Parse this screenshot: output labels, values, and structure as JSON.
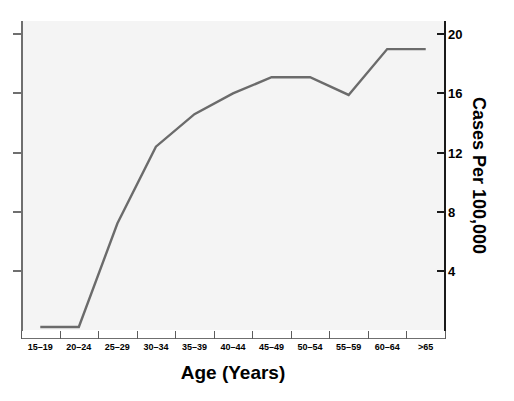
{
  "figure": {
    "title": "",
    "background_color": "#ffffff",
    "plot_background_color": "#f4f4f4",
    "line_color": "#6b6b6b"
  },
  "axes": {
    "x_title": "Age (Years)",
    "y_title": "Cases Per 100,000",
    "y_tick_labels": [
      "20",
      "16",
      "12",
      "8",
      "4"
    ],
    "y_tick_values": [
      20,
      16,
      12,
      8,
      4
    ],
    "y_axis_position": "right",
    "left_axis_labeled": false
  },
  "chart_data": {
    "type": "line",
    "title": "",
    "xlabel": "Age (Years)",
    "ylabel": "Cases Per 100,000",
    "categories": [
      "15–19",
      "20–24",
      "25–29",
      "30–34",
      "35–39",
      "40–44",
      "45–49",
      "50–54",
      "55–59",
      "60–64",
      ">65"
    ],
    "values": [
      0.2,
      0.2,
      7.2,
      12.4,
      14.6,
      16.0,
      17.1,
      17.1,
      15.9,
      19.0,
      19.0
    ],
    "ylim": [
      0,
      20.9
    ],
    "yticks": [
      4,
      8,
      12,
      16,
      20
    ],
    "grid": false,
    "legend": false,
    "series_color": "#6b6b6b"
  }
}
